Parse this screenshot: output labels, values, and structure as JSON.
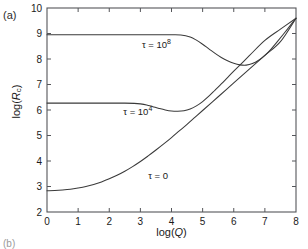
{
  "figure": {
    "panel_label_a": "(a)",
    "panel_label_b": "(b)"
  },
  "chart_data": {
    "type": "line",
    "title": "",
    "xlabel": "log(Q)",
    "ylabel": "log(R_c)",
    "xlim": [
      0,
      8
    ],
    "ylim": [
      2,
      10
    ],
    "xticks": [
      0,
      1,
      2,
      3,
      4,
      5,
      6,
      7,
      8
    ],
    "xticklabels": [
      "0",
      "1",
      "2",
      "3",
      "4",
      "5",
      "6",
      "7",
      "8"
    ],
    "yticks": [
      2,
      3,
      4,
      5,
      6,
      7,
      8,
      9,
      10
    ],
    "yticklabels": [
      "2",
      "3",
      "4",
      "5",
      "6",
      "7",
      "8",
      "9",
      "10"
    ],
    "grid": false,
    "legend_position": "inline-annotations",
    "line_color": "#3a3a3a",
    "frame_color": "#55565a",
    "annotations": [
      {
        "text": "t = 108",
        "base": "t = 10",
        "sup": "8",
        "x": 3.05,
        "y": 8.45
      },
      {
        "text": "t = 104",
        "base": "t = 10",
        "sup": "4",
        "x": 2.45,
        "y": 5.82
      },
      {
        "text": "t = 0",
        "base": "t = 0",
        "sup": "",
        "x": 3.25,
        "y": 3.28
      }
    ],
    "series": [
      {
        "name": "tau = 10^8",
        "label": "t = 10^8",
        "x": [
          0.0,
          0.5,
          1.0,
          1.5,
          2.0,
          2.5,
          3.0,
          3.5,
          4.0,
          4.3,
          4.6,
          4.8,
          5.0,
          5.2,
          5.4,
          5.6,
          5.8,
          6.0,
          6.2,
          6.4,
          6.6,
          6.8,
          7.0,
          7.2,
          7.4,
          7.6,
          7.8,
          8.0
        ],
        "y": [
          8.95,
          8.95,
          8.95,
          8.95,
          8.95,
          8.95,
          8.95,
          8.95,
          8.95,
          8.94,
          8.86,
          8.74,
          8.58,
          8.4,
          8.22,
          8.06,
          7.93,
          7.83,
          7.77,
          7.76,
          7.82,
          7.95,
          8.14,
          8.39,
          8.68,
          8.98,
          9.29,
          9.6
        ]
      },
      {
        "name": "tau = 10^4",
        "label": "t = 10^4",
        "x": [
          0.0,
          0.5,
          1.0,
          1.5,
          2.0,
          2.5,
          2.8,
          3.0,
          3.2,
          3.4,
          3.6,
          3.8,
          4.0,
          4.2,
          4.4,
          4.6,
          4.8,
          5.0,
          5.2,
          5.4,
          5.6,
          5.8,
          6.0,
          6.5,
          7.0,
          7.5,
          8.0
        ],
        "y": [
          6.27,
          6.27,
          6.27,
          6.27,
          6.27,
          6.27,
          6.26,
          6.24,
          6.2,
          6.13,
          6.06,
          6.0,
          5.96,
          5.95,
          5.97,
          6.04,
          6.16,
          6.33,
          6.54,
          6.78,
          7.02,
          7.27,
          7.52,
          8.13,
          8.73,
          9.17,
          9.6
        ]
      },
      {
        "name": "tau = 0",
        "label": "t = 0",
        "x": [
          0.0,
          0.25,
          0.5,
          0.75,
          1.0,
          1.25,
          1.5,
          1.75,
          2.0,
          2.25,
          2.5,
          2.75,
          3.0,
          3.25,
          3.5,
          3.75,
          4.0,
          4.25,
          4.5,
          4.75,
          5.0,
          5.5,
          6.0,
          6.5,
          7.0,
          7.5,
          8.0
        ],
        "y": [
          2.83,
          2.84,
          2.86,
          2.89,
          2.94,
          3.0,
          3.08,
          3.18,
          3.3,
          3.44,
          3.6,
          3.78,
          3.98,
          4.2,
          4.43,
          4.67,
          4.92,
          5.18,
          5.44,
          5.71,
          5.98,
          6.52,
          7.06,
          7.6,
          8.14,
          8.68,
          9.6
        ]
      }
    ]
  }
}
